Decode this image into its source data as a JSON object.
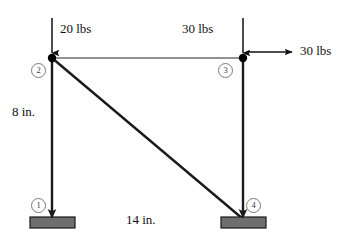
{
  "figure": {
    "colors": {
      "member_dark": "#1a1a1a",
      "member_light": "#6e6e6e",
      "support_fill": "#6e6e6e",
      "support_stroke": "#1a1a1a",
      "node_fill": "#000000",
      "text": "#111111",
      "node_circle_stroke": "#7a7a7a",
      "background": "#ffffff"
    }
  },
  "nodes": [
    {
      "id": "1",
      "label": "1",
      "x": 52,
      "y": 217,
      "kind": "support",
      "marker": "arrowhead"
    },
    {
      "id": "2",
      "label": "2",
      "x": 52,
      "y": 58,
      "kind": "joint",
      "marker": "dot"
    },
    {
      "id": "3",
      "label": "3",
      "x": 243,
      "y": 58,
      "kind": "joint",
      "marker": "dot"
    },
    {
      "id": "4",
      "label": "4",
      "x": 243,
      "y": 217,
      "kind": "support",
      "marker": "arrowhead"
    }
  ],
  "members": [
    {
      "name": "left-column",
      "from": "2",
      "to": "1",
      "style": "dark"
    },
    {
      "name": "right-column",
      "from": "3",
      "to": "4",
      "style": "dark"
    },
    {
      "name": "top-chord",
      "from": "2",
      "to": "3",
      "style": "light"
    },
    {
      "name": "diagonal-brace",
      "from": "2",
      "to": "4",
      "style": "dark"
    }
  ],
  "supports": [
    {
      "name": "support-plate-node-1",
      "node": "1",
      "x": 30,
      "y": 217,
      "width": 45,
      "height": 11
    },
    {
      "name": "support-plate-node-4",
      "node": "4",
      "x": 221,
      "y": 217,
      "width": 45,
      "height": 11
    }
  ],
  "loads": [
    {
      "name": "vertical-load-node-2",
      "label": "20 lbs",
      "magnitude": 20,
      "unit": "lbs",
      "direction": "down",
      "applied_at": "2",
      "label_x": 60,
      "label_y": 22
    },
    {
      "name": "vertical-load-node-3",
      "label": "30 lbs",
      "magnitude": 30,
      "unit": "lbs",
      "direction": "down",
      "applied_at": "3",
      "label_x": 182,
      "label_y": 22
    },
    {
      "name": "horizontal-load-node-3",
      "label": "30 lbs",
      "magnitude": 30,
      "unit": "lbs",
      "direction": "right",
      "applied_at": "3",
      "label_x": 300,
      "label_y": 44
    }
  ],
  "dimensions": [
    {
      "name": "height-dimension",
      "label": "8 in.",
      "value": 8,
      "unit": "in.",
      "orientation": "vertical",
      "label_x": 12,
      "label_y": 105
    },
    {
      "name": "span-dimension",
      "label": "14 in.",
      "value": 14,
      "unit": "in.",
      "orientation": "horizontal",
      "label_x": 126,
      "label_y": 213
    }
  ]
}
